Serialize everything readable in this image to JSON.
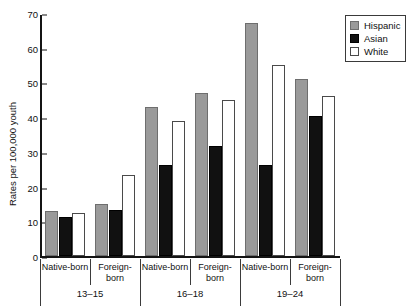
{
  "chart_data": {
    "type": "bar",
    "title": "",
    "xlabel": "",
    "ylabel": "Rates per 100,000 youth",
    "ylim": [
      0,
      70
    ],
    "yticks": [
      0,
      10,
      20,
      30,
      40,
      50,
      60,
      70
    ],
    "grid": false,
    "legend_position": "top-right",
    "categories": [
      "Native-born",
      "Foreign-born",
      "Native-born",
      "Foreign-born",
      "Native-born",
      "Foreign-born"
    ],
    "group_labels": [
      "13–15",
      "16–18",
      "19–24"
    ],
    "series": [
      {
        "name": "Hispanic",
        "color": "#9a9a9a",
        "values": [
          13.0,
          15.0,
          43.0,
          47.0,
          67.0,
          51.0
        ]
      },
      {
        "name": "Asian",
        "color": "#111111",
        "values": [
          11.2,
          13.3,
          26.1,
          31.8,
          26.3,
          40.3
        ]
      },
      {
        "name": "White",
        "color": "#ffffff",
        "values": [
          12.3,
          23.3,
          38.8,
          45.0,
          55.0,
          46.0
        ]
      }
    ]
  },
  "axis": {
    "y_label": "Rates per 100,000 youth",
    "y_ticks": [
      "70",
      "60",
      "50",
      "40",
      "30",
      "20",
      "10",
      "0"
    ]
  },
  "legend": {
    "items": [
      {
        "label": "Hispanic",
        "swatch": "hispanic"
      },
      {
        "label": "Asian",
        "swatch": "asian"
      },
      {
        "label": "White",
        "swatch": "white"
      }
    ]
  },
  "x_axis": {
    "tick_labels": [
      "Native-born",
      "Foreign-born",
      "Native-born",
      "Foreign-born",
      "Native-born",
      "Foreign-born"
    ],
    "group_labels": [
      "13–15",
      "16–18",
      "19–24"
    ]
  },
  "clipped_title": ""
}
